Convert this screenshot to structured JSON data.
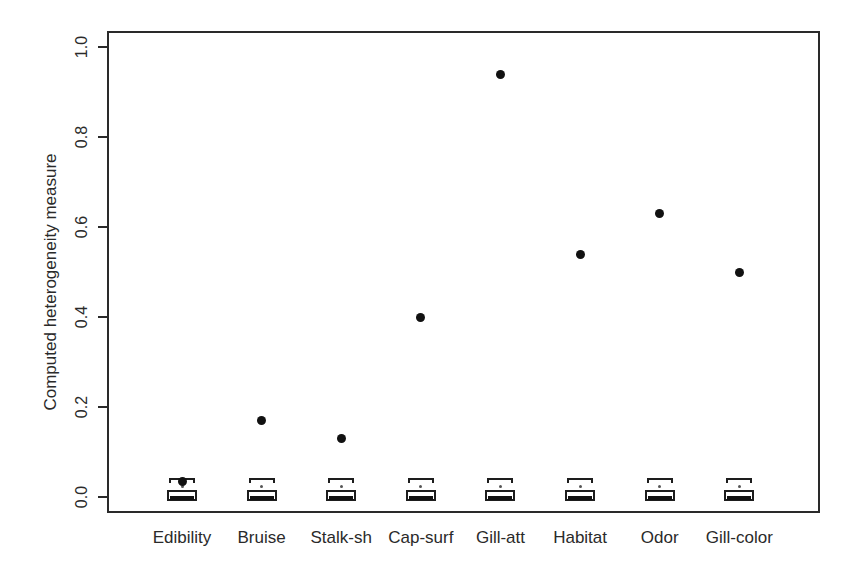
{
  "figure": {
    "ylabel": "Computed heterogeneity measure"
  },
  "chart_data": {
    "type": "boxplot",
    "title": "",
    "xlabel": "",
    "ylabel": "Computed heterogeneity measure",
    "categories": [
      "Edibility",
      "Bruise",
      "Stalk-sh",
      "Cap-surf",
      "Gill-att",
      "Habitat",
      "Odor",
      "Gill-color"
    ],
    "points": {
      "name": "computed-heterogeneity-dot",
      "marker": "filled-circle",
      "values": [
        0.035,
        0.17,
        0.13,
        0.4,
        0.94,
        0.54,
        0.63,
        0.5
      ]
    },
    "boxplots": {
      "note": "one near-zero reference boxplot per category, visually identical",
      "upper_whisker": 0.042,
      "q3": 0.015,
      "median": 0.001,
      "q1": -0.009,
      "mean_marker": 0.023
    },
    "y_ticks": [
      0.0,
      0.2,
      0.4,
      0.6,
      0.8,
      1.0
    ],
    "y_tick_labels": [
      "0.0",
      "0.2",
      "0.4",
      "0.6",
      "0.8",
      "1.0"
    ],
    "ylim": [
      -0.04,
      1.04
    ],
    "grid": false,
    "legend": null,
    "marker_color": "#111111",
    "axis_color": "#2a2a2a",
    "background_color": "#ffffff"
  }
}
